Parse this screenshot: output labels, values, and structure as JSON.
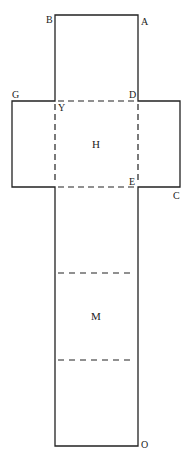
{
  "diagram": {
    "type": "box-net",
    "vertex_labels": {
      "A": "A",
      "B": "B",
      "C": "C",
      "D": "D",
      "E": "E",
      "G": "G",
      "Y": "Y",
      "O": "O"
    },
    "face_labels": {
      "top_face": "H",
      "middle_face": "M"
    },
    "colors": {
      "line": "#222222",
      "background": "#ffffff"
    }
  }
}
